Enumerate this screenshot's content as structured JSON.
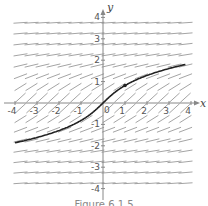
{
  "chart_data": {
    "type": "line",
    "subtype": "slope-field",
    "title": "",
    "caption": "Figure 6.1.5",
    "xlabel": "x",
    "ylabel": "y",
    "xlim": [
      -4.3,
      4.3
    ],
    "ylim": [
      -4.3,
      4.3
    ],
    "x_ticks": [
      -4,
      -3,
      -2,
      -1,
      1,
      2,
      3,
      4
    ],
    "y_ticks": [
      -4,
      -3,
      -2,
      -1,
      1,
      2,
      3,
      4
    ],
    "x_tick_labels": [
      "-4",
      "-3",
      "-2",
      "-1",
      "1",
      "2",
      "3",
      "4"
    ],
    "y_tick_labels": [
      "-4",
      "-3",
      "-2",
      "-1",
      "1",
      "2",
      "3",
      "4"
    ],
    "origin_label": "0",
    "grid": false,
    "slope_field": {
      "equation": "dy/dx = 1/(1+y^2)",
      "x_range": [
        -3.75,
        3.75
      ],
      "y_range": [
        -3.75,
        3.75
      ],
      "step": 0.5,
      "segment_length": 0.32,
      "color": "#9a9a9a"
    },
    "series": [
      {
        "name": "solution curve",
        "relation": "y + y^3/3 = x",
        "x": [
          -4.4,
          -4,
          -3.5,
          -3,
          -2.5,
          -2,
          -1.5,
          -1,
          -0.5,
          0,
          0.5,
          1,
          1.5,
          2,
          2.5,
          3,
          3.5,
          4,
          4.3
        ],
        "y": [
          -1.83,
          -1.74,
          -1.62,
          -1.48,
          -1.33,
          -1.16,
          -0.96,
          -0.82,
          -0.47,
          0,
          0.47,
          0.82,
          0.96,
          1.16,
          1.33,
          1.48,
          1.62,
          1.74,
          1.8
        ],
        "color": "#222222"
      }
    ],
    "marked_point": {
      "x": 1,
      "y": 0.82
    }
  },
  "colors": {
    "axis": "#888888",
    "curve": "#222222",
    "slope_marks": "#9a9a9a",
    "text": "#555555"
  }
}
